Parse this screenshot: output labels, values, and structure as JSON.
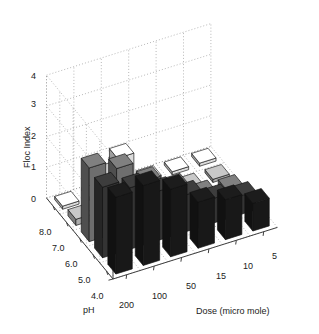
{
  "chart_data": {
    "type": "bar",
    "render": "3d-bar",
    "title": "",
    "xlabel": "Dose (micro mole)",
    "ylabel": "pH",
    "zlabel": "Floc Index",
    "zlim": [
      0,
      4
    ],
    "zticks": [
      0,
      1,
      2,
      3,
      4
    ],
    "ztick_labels": [
      "0",
      "1",
      "2",
      "3",
      "4"
    ],
    "grid": true,
    "legend": "none",
    "x_categories": [
      "200",
      "100",
      "50",
      "15",
      "10",
      "5"
    ],
    "y_categories": [
      "8.0",
      "7.0",
      "6.0",
      "5.0",
      "4.0"
    ],
    "series": [
      {
        "name": "pH 8.0",
        "color": "#1c1c1c",
        "values": [
          2.5,
          2.6,
          2.2,
          1.5,
          1.3,
          0.9
        ]
      },
      {
        "name": "pH 7.0",
        "color": "#3d3d3d",
        "values": [
          2.3,
          2.0,
          1.6,
          1.2,
          0.8,
          0.6
        ]
      },
      {
        "name": "pH 6.0",
        "color": "#808080",
        "values": [
          2.4,
          2.1,
          1.4,
          0.9,
          0.4,
          0.3
        ]
      },
      {
        "name": "pH 5.0",
        "color": "#c8c8c8",
        "values": [
          0.2,
          1.3,
          0.15,
          0.1,
          0.1,
          0.1
        ]
      },
      {
        "name": "pH 4.0",
        "color": "#ffffff",
        "values": [
          0.1,
          0.1,
          1.1,
          0.1,
          0.1,
          0.1
        ]
      }
    ]
  },
  "axes": {
    "z_title": "Floc Index",
    "y_title": "pH",
    "x_title": "Dose (micro mole)",
    "z_ticks": [
      "4",
      "3",
      "2",
      "1",
      "0"
    ],
    "y_ticks": [
      "8.0",
      "7.0",
      "6.0",
      "5.0",
      "4.0"
    ],
    "x_ticks": [
      "200",
      "100",
      "50",
      "15",
      "10",
      "5"
    ]
  }
}
